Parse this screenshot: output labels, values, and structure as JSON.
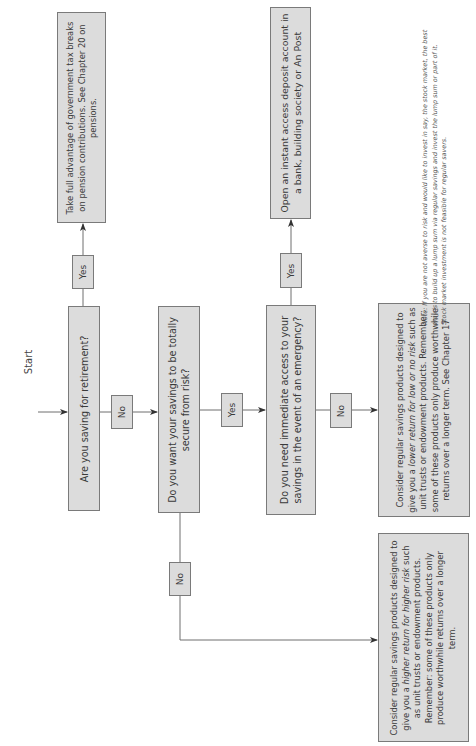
{
  "start_label": "Start",
  "questions": {
    "retirement": "Are you saving for retirement?",
    "secure": "Do you want your savings to be totally secure from risk?",
    "emergency": "Do you need immediate access to your savings in the event of an emergency?"
  },
  "branch_labels": {
    "retirement_yes": "Yes",
    "retirement_no": "No",
    "secure_yes": "Yes",
    "secure_no": "No",
    "emergency_yes": "Yes",
    "emergency_no": "No"
  },
  "results": {
    "pension": "Take full advantage of government tax breaks on pension contributions. See Chapter 20 on pensions.",
    "deposit": "Open an instant access deposit account in a bank, building society or An Post",
    "lower_return": {
      "pre": "Consider regular savings products designed to give you a ",
      "em": "lower return for low or no risk",
      "post": " such as unit trusts or endowment products. Remember: some of these products only produce worthwhile returns over a longer term. See Chapter 17"
    },
    "higher_return": {
      "pre": "Consider regular savings products designed to give you a ",
      "em": "higher return for higher risk",
      "post": " such as unit trusts or endowment products. Remember: some of these products only produce worthwhile returns over a longer term."
    }
  },
  "note": "Note: If you are not averse to risk and would like to invest in say, the stock market, the best way is to build up a lump sum via regular savings and invest the lump sum or part of it. Stock market investment is not feasible for regular savers.",
  "colors": {
    "box_fill": "#dcdcdc",
    "box_border": "#7a7a7a",
    "line": "#6e6e6e",
    "arrow": "#333333"
  }
}
